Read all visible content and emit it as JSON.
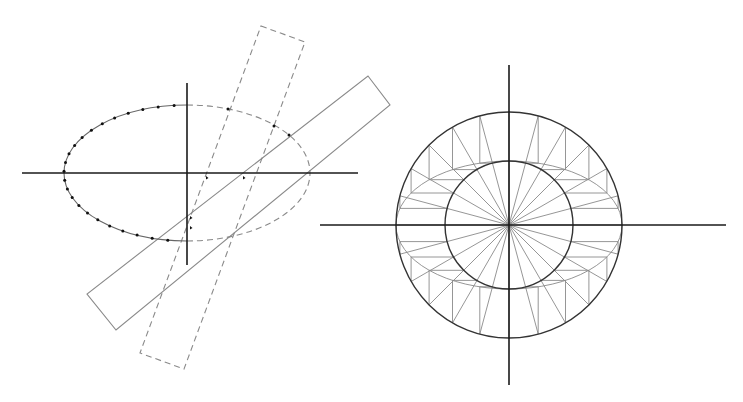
{
  "colors": {
    "axis": "#1a1a1a",
    "circle": "#333333",
    "construction": "#8a8a8a",
    "dots": "#111111",
    "background": "#ffffff"
  },
  "left_figure": {
    "description": "Ellipse construction with two rotated rectangular strips (trammel method)",
    "axes": {
      "horizontal": {
        "x1": 22,
        "y1": 173,
        "x2": 358,
        "y2": 173
      },
      "vertical": {
        "x1": 187,
        "y1": 83,
        "x2": 187,
        "y2": 265
      }
    },
    "ellipse": {
      "cx": 187,
      "cy": 173,
      "rx": 123,
      "ry": 68,
      "left_half": "solid",
      "right_half": "dashed"
    },
    "dotted_points_count": 24,
    "axis_ticks": [
      {
        "x": 207,
        "y": 178
      },
      {
        "x": 244,
        "y": 178
      },
      {
        "x": 191,
        "y": 218
      },
      {
        "x": 191,
        "y": 228
      }
    ],
    "extra_points": [
      {
        "x": 228,
        "y": 109
      },
      {
        "x": 289,
        "y": 135
      },
      {
        "x": 274,
        "y": 126
      }
    ],
    "dashed_rectangle": [
      [
        261,
        26
      ],
      [
        305,
        42
      ],
      [
        184,
        369
      ],
      [
        140,
        353
      ]
    ],
    "solid_rectangle": [
      [
        368,
        76
      ],
      [
        390,
        105
      ],
      [
        116,
        330
      ],
      [
        87,
        294
      ]
    ]
  },
  "right_figure": {
    "description": "Concentric circles method of ellipse construction with 24 radial lines",
    "center": {
      "x": 509,
      "y": 225
    },
    "outer_radius": 113,
    "inner_radius": 64,
    "radial_line_count": 24,
    "axes": {
      "horizontal": {
        "x1": 320,
        "y1": 225,
        "x2": 726,
        "y2": 225
      },
      "vertical": {
        "x1": 509,
        "y1": 65,
        "x2": 509,
        "y2": 385
      }
    }
  }
}
